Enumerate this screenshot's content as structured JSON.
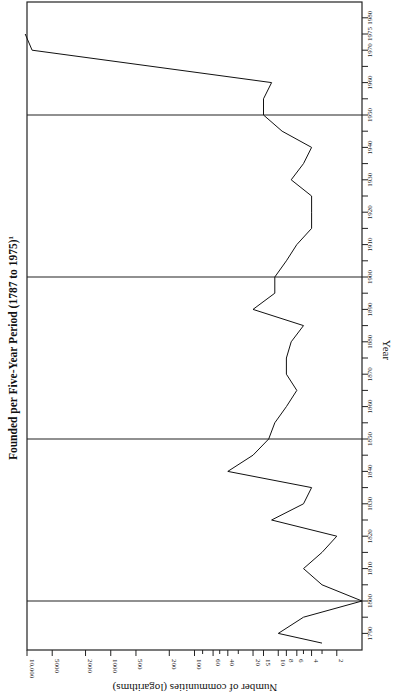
{
  "chart_data": {
    "type": "line",
    "title": "Founded per Five-Year Period (1787 to 1975)",
    "title_footnote": "1",
    "xlabel": "Year",
    "ylabel": "Number of communities (logarithms)",
    "orientation": "rotated 90° (year axis vertical on right, value axis horizontal at bottom, reversed)",
    "y_scale": "log",
    "ylim": [
      1,
      10000
    ],
    "y_ticks": [
      10000,
      5000,
      2000,
      1000,
      500,
      200,
      100,
      60,
      40,
      20,
      15,
      10,
      8,
      6,
      4,
      2
    ],
    "y_tick_labels": [
      "10,000",
      "5000",
      "2000",
      "1000",
      "500",
      "200",
      "100",
      "60",
      "40",
      "20",
      "15",
      "10",
      "8",
      "6",
      "4",
      "2"
    ],
    "x_ticks": [
      1790,
      1800,
      1810,
      1820,
      1830,
      1840,
      1850,
      1860,
      1870,
      1880,
      1890,
      1900,
      1910,
      1920,
      1930,
      1940,
      1950,
      1960,
      1970,
      1975,
      1980
    ],
    "x_tick_labels": [
      "1790",
      "1800",
      "1810",
      "1820",
      "1830",
      "1840",
      "1850",
      "1860",
      "1870",
      "1880",
      "1890",
      "1900",
      "1910",
      "1920",
      "1930",
      "1940",
      "1950",
      "1960",
      "1970",
      "1975",
      "1980"
    ],
    "xlim": [
      1787,
      1982
    ],
    "reference_lines": [
      1800,
      1850,
      1900,
      1950
    ],
    "grid": false,
    "legend": null,
    "series": [
      {
        "name": "Communities founded",
        "x": [
          1787,
          1790,
          1795,
          1800,
          1805,
          1810,
          1815,
          1820,
          1825,
          1830,
          1835,
          1840,
          1845,
          1850,
          1855,
          1860,
          1865,
          1870,
          1875,
          1880,
          1885,
          1890,
          1895,
          1900,
          1905,
          1910,
          1915,
          1920,
          1925,
          1930,
          1935,
          1940,
          1945,
          1950,
          1955,
          1960,
          1970,
          1975
        ],
        "values": [
          3,
          10,
          5,
          1,
          3,
          5,
          3,
          2,
          12,
          5,
          4,
          40,
          20,
          13,
          11,
          8,
          6,
          8,
          8,
          7,
          5,
          20,
          11,
          11,
          8,
          6,
          4,
          4,
          4,
          7,
          5,
          4,
          9,
          15,
          15,
          12,
          8700,
          10500
        ]
      }
    ]
  }
}
